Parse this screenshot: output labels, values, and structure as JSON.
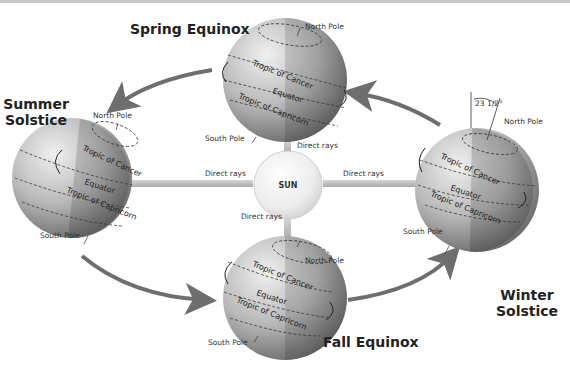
{
  "diagram": {
    "sun": {
      "label": "SUN"
    },
    "rays": {
      "top": "Direct rays",
      "left": "Direct rays",
      "right": "Direct rays",
      "bottom": "Direct rays"
    },
    "tilt_label": "23 1/2°",
    "seasons": {
      "spring": {
        "title": "Spring Equinox",
        "north_pole": "North Pole",
        "south_pole": "South Pole",
        "tropic_cancer": "Tropic of Cancer",
        "equator": "Equator",
        "tropic_capricorn": "Tropic of Capricorn"
      },
      "summer": {
        "title_line1": "Summer",
        "title_line2": "Solstice",
        "north_pole": "North Pole",
        "south_pole": "South Pole",
        "tropic_cancer": "Tropic of Cancer",
        "equator": "Equator",
        "tropic_capricorn": "Tropic of Capricorn"
      },
      "fall": {
        "title": "Fall Equinox",
        "north_pole": "North Pole",
        "south_pole": "South Pole",
        "tropic_cancer": "Tropic of Cancer",
        "equator": "Equator",
        "tropic_capricorn": "Tropic of Capricorn"
      },
      "winter": {
        "title_line1": "Winter",
        "title_line2": "Solstice",
        "north_pole": "North Pole",
        "south_pole": "South Pole",
        "tropic_cancer": "Tropic of Cancer",
        "equator": "Equator",
        "tropic_capricorn": "Tropic of Capricorn"
      }
    },
    "colors": {
      "arrow": "#6e6e6e",
      "ray": "#bdbdbd",
      "globe_light": "#d9d9d9",
      "globe_dark": "#7a7a7a"
    }
  }
}
